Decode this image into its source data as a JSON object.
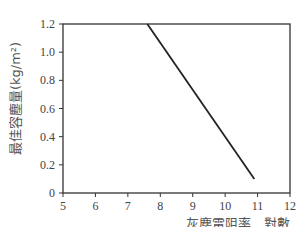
{
  "chart_data": {
    "type": "line",
    "title": "",
    "xlabel": "灰塵電阻率　對數",
    "xlabel_line2": "Log ρ /Ω · cm",
    "ylabel": "最佳容塵量(kg/m²)",
    "xlim": [
      5,
      12
    ],
    "ylim": [
      0,
      1.2
    ],
    "x_ticks": [
      "5",
      "6",
      "7",
      "8",
      "9",
      "10",
      "11",
      "12"
    ],
    "y_ticks": [
      "0",
      "0.2",
      "0.4",
      "0.6",
      "0.8",
      "1.0",
      "1.2"
    ],
    "grid": false,
    "legend": null,
    "series": [
      {
        "name": "最佳容塵量",
        "x": [
          7.6,
          10.9
        ],
        "y": [
          1.2,
          0.1
        ],
        "color": "#222222"
      }
    ]
  }
}
